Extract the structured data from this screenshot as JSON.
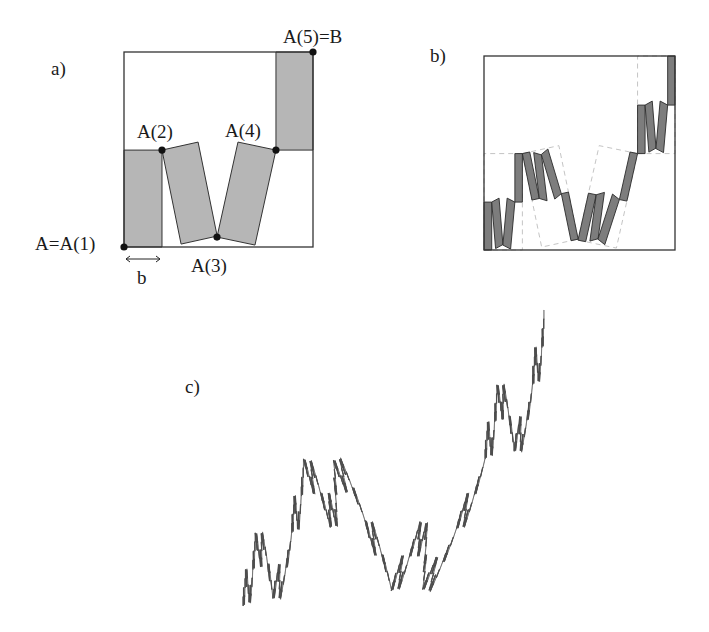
{
  "panels": {
    "a": {
      "label": "a)",
      "points": {
        "p1": "A=A(1)",
        "p2": "A(2)",
        "p3": "A(3)",
        "p4": "A(4)",
        "p5": "A(5)=B"
      },
      "width_label": "b",
      "generator_points": [
        [
          0,
          0
        ],
        [
          0.201,
          0.497
        ],
        [
          0.492,
          0.051
        ],
        [
          0.804,
          0.497
        ],
        [
          1,
          1
        ]
      ],
      "fill": "#b6b6b6"
    },
    "b": {
      "label": "b)",
      "fill": "#7d7d7d",
      "iteration": 2
    },
    "c": {
      "label": "c)",
      "fill": "#5a5a5a",
      "iteration": 5
    }
  },
  "colors": {
    "outline": "#333333",
    "dashed": "#bdbdbd",
    "dot": "#111111"
  }
}
